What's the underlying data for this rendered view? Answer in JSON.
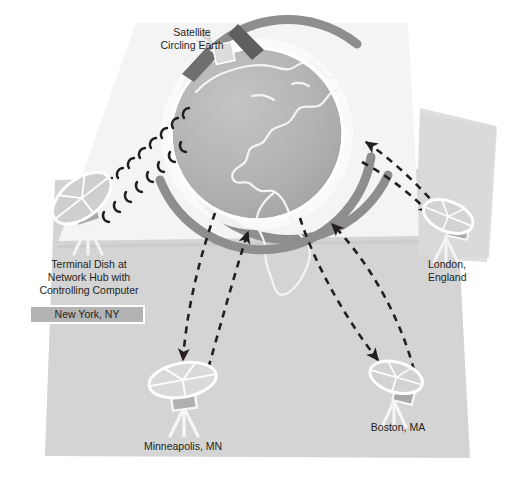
{
  "diagram": {
    "colors": {
      "panel_light": "#f2f2f2",
      "panel_gray": "#d6d6d6",
      "panel_gray_dark": "#cfcfcf",
      "globe_fill": "#b0b0b0",
      "globe_ring": "#9a9a9a",
      "orbit_ring": "#8c8c8c",
      "dish_fill": "#cdcdcd",
      "dish_outline": "#ffffff",
      "dish_body": "#a6a6a6",
      "satellite_panel": "#6e6e6e",
      "arrow": "#231f20",
      "text": "#231f20",
      "highlight_box": "#b3b3b3",
      "highlight_border": "#ffffff"
    },
    "labels": {
      "satellite": "Satellite\nCircling Earth",
      "terminal_dish": "Terminal Dish at\nNetwork Hub with\nControlling Computer",
      "new_york": "New York, NY",
      "london": "London,\nEngland",
      "minneapolis": "Minneapolis, MN",
      "boston": "Boston, MA"
    },
    "nodes": [
      {
        "id": "satellite",
        "name": "satellite",
        "label": "Satellite Circling Earth"
      },
      {
        "id": "earth",
        "name": "earth-globe",
        "label": "Earth"
      },
      {
        "id": "new-york",
        "name": "terminal-dish-new-york",
        "label": "New York, NY",
        "role": "Terminal Dish at Network Hub with Controlling Computer",
        "highlighted": true
      },
      {
        "id": "london",
        "name": "dish-london",
        "label": "London, England"
      },
      {
        "id": "minneapolis",
        "name": "dish-minneapolis",
        "label": "Minneapolis, MN"
      },
      {
        "id": "boston",
        "name": "dish-boston",
        "label": "Boston, MA"
      }
    ],
    "links": [
      {
        "from": "new-york",
        "to": "satellite",
        "style": "signal-waves",
        "direction": "bidirectional"
      },
      {
        "from": "earth",
        "to": "minneapolis",
        "style": "dashed-arrow",
        "direction": "down"
      },
      {
        "from": "minneapolis",
        "to": "earth",
        "style": "dashed-arrow",
        "direction": "up"
      },
      {
        "from": "earth",
        "to": "boston",
        "style": "dashed-arrow",
        "direction": "down"
      },
      {
        "from": "boston",
        "to": "earth",
        "style": "dashed-arrow",
        "direction": "up"
      },
      {
        "from": "earth",
        "to": "london",
        "style": "dashed-arrow",
        "direction": "down"
      },
      {
        "from": "london",
        "to": "earth",
        "style": "dashed-arrow",
        "direction": "up"
      }
    ]
  }
}
